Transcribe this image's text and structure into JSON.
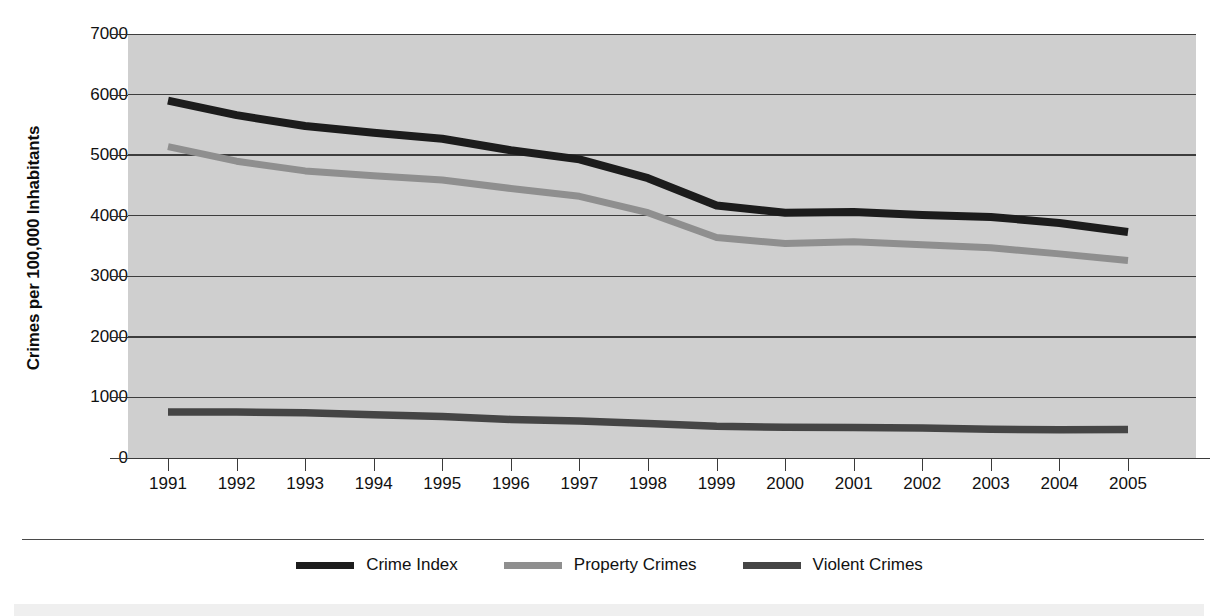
{
  "axes": {
    "ylabel": "Crimes per 100,000 Inhabitants",
    "xlabel": "",
    "yticks": [
      "0",
      "1000",
      "2000",
      "3000",
      "4000",
      "5000",
      "6000",
      "7000"
    ]
  },
  "legend": {
    "items": [
      {
        "label": "Crime Index",
        "color": "#1c1c1c"
      },
      {
        "label": "Property Crimes",
        "color": "#8f8f8f"
      },
      {
        "label": "Violent Crimes",
        "color": "#454545"
      }
    ]
  },
  "chart_data": {
    "type": "line",
    "title": "",
    "xlabel": "",
    "ylabel": "Crimes per 100,000 Inhabitants",
    "x": [
      "1991",
      "1992",
      "1993",
      "1994",
      "1995",
      "1996",
      "1997",
      "1998",
      "1999",
      "2000",
      "2001",
      "2002",
      "2003",
      "2004",
      "2005"
    ],
    "xlim": [
      "1991",
      "2005"
    ],
    "ylim": [
      0,
      7000
    ],
    "ytick_step": 1000,
    "grid": true,
    "grid_axis": "y",
    "legend_position": "bottom",
    "plot_background": "#cfcfcf",
    "series": [
      {
        "name": "Crime Index",
        "color": "#1c1c1c",
        "values": [
          5900,
          5660,
          5480,
          5370,
          5270,
          5080,
          4930,
          4620,
          4170,
          4050,
          4060,
          4010,
          3980,
          3880,
          3730
        ]
      },
      {
        "name": "Property Crimes",
        "color": "#8f8f8f",
        "values": [
          5140,
          4900,
          4740,
          4660,
          4590,
          4450,
          4320,
          4050,
          3640,
          3540,
          3570,
          3520,
          3470,
          3370,
          3260
        ]
      },
      {
        "name": "Violent Crimes",
        "color": "#454545",
        "values": [
          758,
          758,
          747,
          714,
          685,
          637,
          611,
          568,
          523,
          507,
          505,
          495,
          476,
          465,
          470
        ]
      }
    ]
  }
}
